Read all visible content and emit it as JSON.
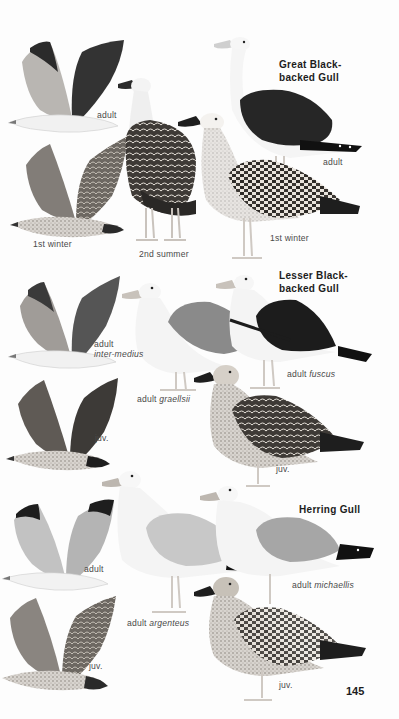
{
  "page": {
    "page_number": "145",
    "background": "#fdfdfd"
  },
  "species": [
    {
      "name_line1": "Great Black-",
      "name_line2": "backed Gull",
      "plates": [
        {
          "label": "adult",
          "pose": "flight",
          "mantle_color": "#2e2e2e"
        },
        {
          "label": "1st winter",
          "pose": "flight",
          "mantle_color": "#6e6a66"
        },
        {
          "label": "2nd summer",
          "pose": "standing",
          "mantle_color": "#3a3835"
        },
        {
          "label": "adult",
          "pose": "standing",
          "mantle_color": "#252525"
        },
        {
          "label": "1st winter",
          "pose": "standing",
          "mantle_color": "#8a8580"
        }
      ]
    },
    {
      "name_line1": "Lesser Black-",
      "name_line2": "backed Gull",
      "plates": [
        {
          "label": "adult",
          "label_italic": "inter-medius",
          "pose": "flight",
          "mantle_color": "#4a4a4a"
        },
        {
          "label": "juv.",
          "pose": "flight",
          "mantle_color": "#5a5755"
        },
        {
          "label": "adult",
          "label_italic": "graellsii",
          "pose": "standing",
          "mantle_color": "#8c8c8c"
        },
        {
          "label": "adult",
          "label_italic": "fuscus",
          "pose": "standing",
          "mantle_color": "#1e1e1e"
        },
        {
          "label": "juv.",
          "pose": "standing",
          "mantle_color": "#6a6662"
        }
      ]
    },
    {
      "name_line1": "Herring Gull",
      "plates": [
        {
          "label": "adult",
          "pose": "flight",
          "mantle_color": "#b8b8b8"
        },
        {
          "label": "juv.",
          "pose": "flight",
          "mantle_color": "#7d7975"
        },
        {
          "label": "adult",
          "label_italic": "argenteus",
          "pose": "standing",
          "mantle_color": "#c6c6c6"
        },
        {
          "label": "adult",
          "label_italic": "michaellis",
          "pose": "standing",
          "mantle_color": "#a4a4a4"
        },
        {
          "label": "juv.",
          "pose": "standing",
          "mantle_color": "#8a8580"
        }
      ]
    }
  ]
}
